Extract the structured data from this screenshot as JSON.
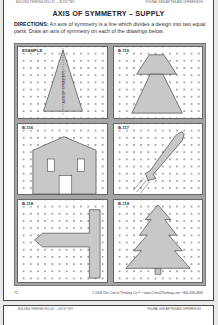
{
  "page": {
    "header_left": "BUILDING THINKING SKILLS® — BOOK TWO",
    "header_right": "FIGURAL SIMILARITIES AND DIFFERENCES",
    "title": "AXIS OF SYMMETRY – SUPPLY",
    "directions_label": "DIRECTIONS:",
    "directions_text": " An axis of symmetry is a line which divides a design into two equal parts. Draw an axis of symmetry on each of the drawings below.",
    "panels": [
      {
        "label": "EXAMPLE",
        "figure": "triangle",
        "axis_label": "AXIS OF SYMMETRY"
      },
      {
        "label": "B-115",
        "figure": "stacked-trapezoids"
      },
      {
        "label": "B-116",
        "figure": "house"
      },
      {
        "label": "B-117",
        "figure": "rocket"
      },
      {
        "label": "B-118",
        "figure": "sideways-T-arrow"
      },
      {
        "label": "B-119",
        "figure": "pine-tree"
      }
    ],
    "page_number": "72",
    "copyright": "© 2006 The Critical Thinking Co.™ • www.CriticalThinking.com • 800-458-4849"
  },
  "next_page": {
    "header_left": "BUILDING THINKING SKILLS® — BOOK TWO",
    "header_right": "FIGURAL SIMILARITIES AND DIFFERENCES"
  },
  "colors": {
    "frame_gray": "#a5a5a5",
    "shape_fill": "#c8c8c8",
    "background": "#e9e9e9"
  }
}
